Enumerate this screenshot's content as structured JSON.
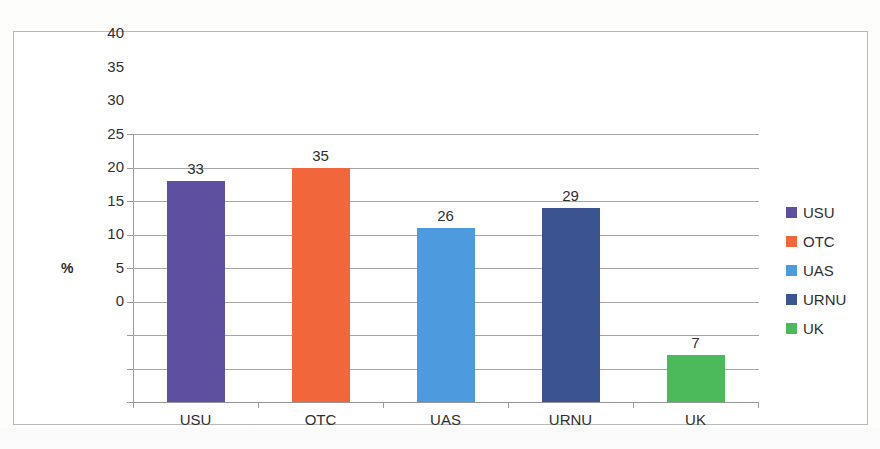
{
  "chart_data": {
    "type": "bar",
    "title": "",
    "subtitle": "",
    "xlabel": "",
    "ylabel": "%",
    "ylim": [
      0,
      40
    ],
    "ytick_step": 5,
    "grid": true,
    "legend_position": "right",
    "categories": [
      "USU",
      "OTC",
      "UAS",
      "URNU",
      "UK"
    ],
    "values": [
      33,
      35,
      26,
      29,
      7
    ],
    "ytick_labels": [
      "40",
      "35",
      "30",
      "25",
      "20",
      "15",
      "10",
      "5",
      "0"
    ],
    "ytick_values": [
      40,
      35,
      30,
      25,
      20,
      15,
      10,
      5,
      0
    ],
    "data_labels": [
      "33",
      "35",
      "26",
      "29",
      "7"
    ],
    "colors": [
      "#5F4FA0",
      "#F2663C",
      "#4D9BDE",
      "#3B5391",
      "#4CB95A"
    ],
    "legend": [
      {
        "label": "USU",
        "color": "#5F4FA0"
      },
      {
        "label": "OTC",
        "color": "#F2663C"
      },
      {
        "label": "UAS",
        "color": "#4D9BDE"
      },
      {
        "label": "URNU",
        "color": "#3B5391"
      },
      {
        "label": "UK",
        "color": "#4CB95A"
      }
    ]
  }
}
